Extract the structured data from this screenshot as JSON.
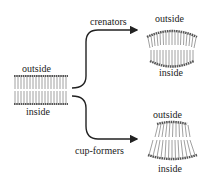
{
  "diagram": {
    "left_membrane": {
      "top_label": "outside",
      "bottom_label": "inside"
    },
    "branches": [
      {
        "label": "crenators",
        "result": {
          "top_label": "outside",
          "bottom_label": "inside",
          "curvature": "convex-outward"
        }
      },
      {
        "label": "cup-formers",
        "result": {
          "top_label": "outside",
          "bottom_label": "inside",
          "curvature": "concave-outward"
        }
      }
    ],
    "colors": {
      "line": "#222222",
      "head": "#555555",
      "tail": "#888888",
      "background": "#ffffff"
    }
  }
}
